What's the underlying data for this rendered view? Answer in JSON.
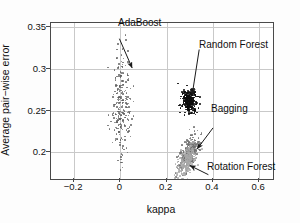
{
  "chart_data": {
    "type": "scatter",
    "title": "",
    "xlabel": "kappa",
    "ylabel": "Average pair−wise error",
    "xlim": [
      -0.3,
      0.66
    ],
    "ylim": [
      0.168,
      0.355
    ],
    "xticks": [
      -0.2,
      0,
      0.2,
      0.4,
      0.6
    ],
    "xticklabels": [
      "−0.2",
      "0",
      "0.2",
      "0.4",
      "0.6"
    ],
    "yticks": [
      0.2,
      0.25,
      0.3,
      0.35
    ],
    "yticklabels": [
      "0.2",
      "0.25",
      "0.3",
      "0.35"
    ],
    "grid": true,
    "legend": "none (inline arrow annotations)",
    "series": [
      {
        "name": "AdaBoost",
        "color": "#5a5a5a",
        "marker": "dot",
        "n_points": 230,
        "center": [
          0.005,
          0.255
        ],
        "x_range": [
          -0.065,
          0.105
        ],
        "y_range": [
          0.178,
          0.302
        ],
        "description": "diffuse elongated vertical cloud near kappa 0, error spanning 0.18-0.30"
      },
      {
        "name": "Random Forest",
        "color": "#0d0d0d",
        "marker": "dot",
        "n_points": 300,
        "center": [
          0.298,
          0.261
        ],
        "x_range": [
          0.255,
          0.345
        ],
        "y_range": [
          0.247,
          0.277
        ],
        "description": "very dense compact dark blob"
      },
      {
        "name": "Bagging",
        "color": "#6e6e6e",
        "marker": "dot",
        "n_points": 260,
        "center": [
          0.298,
          0.2
        ],
        "x_range": [
          0.245,
          0.355
        ],
        "y_range": [
          0.183,
          0.218
        ],
        "description": "medium-gray cluster, upper-right of the lower group"
      },
      {
        "name": "Rotation Forest",
        "color": "#a8a8a8",
        "marker": "dot",
        "n_points": 260,
        "center": [
          0.286,
          0.191
        ],
        "x_range": [
          0.235,
          0.34
        ],
        "y_range": [
          0.173,
          0.208
        ],
        "description": "light-gray cluster, lower-left of the lower group, overlapping Bagging"
      }
    ],
    "annotations": [
      {
        "label": "AdaBoost",
        "text_xy": [
          0.0,
          0.335
        ],
        "points_to": [
          0.055,
          0.3
        ]
      },
      {
        "label": "Random Forest",
        "text_xy": [
          0.345,
          0.322
        ],
        "points_to": [
          0.315,
          0.268
        ]
      },
      {
        "label": "Bagging",
        "text_xy": [
          0.405,
          0.228
        ],
        "points_to": [
          0.337,
          0.203
        ]
      },
      {
        "label": "Rotation Forest",
        "text_xy": [
          0.385,
          0.172
        ],
        "points_to": [
          0.305,
          0.183
        ]
      }
    ]
  },
  "axes": {
    "x_title": "kappa",
    "y_title": "Average pair−wise error",
    "x_tick_labels": [
      "−0.2",
      "0",
      "0.2",
      "0.4",
      "0.6"
    ],
    "y_tick_labels": [
      "0.2",
      "0.25",
      "0.3",
      "0.35"
    ]
  },
  "labels": {
    "adaboost": "AdaBoost",
    "random_forest": "Random Forest",
    "bagging": "Bagging",
    "rotation_forest": "Rotation Forest"
  },
  "colors": {
    "adaboost": "#5a5a5a",
    "random_forest": "#0d0d0d",
    "bagging": "#6e6e6e",
    "rotation_forest": "#a8a8a8",
    "axis": "#4a4a4a",
    "grid": "#c9c9c9",
    "background": "#ffffff"
  }
}
